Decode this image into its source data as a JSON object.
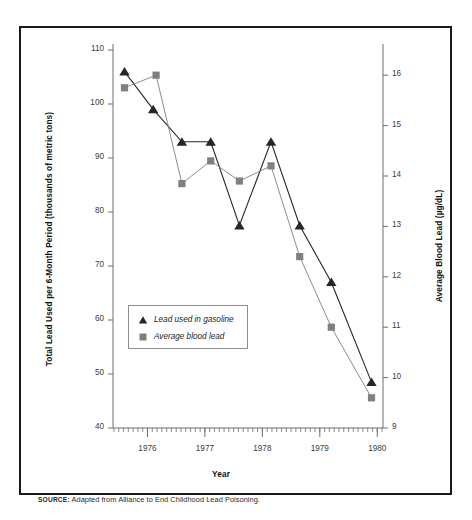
{
  "source": {
    "label": "SOURCE:",
    "text": "Adapted from Alliance to End Childhood Lead Poisoning."
  },
  "colors": {
    "gasoline_series": "#262626",
    "blood_series": "#808080",
    "axis": "#6e6e6e",
    "frame": "#1a1a1a",
    "text": "#111111"
  },
  "chart_data": {
    "type": "line",
    "title": "",
    "xlabel": "Year",
    "ylabel": "Total Lead Used per 6-Month Period (thousands of metric tons)",
    "y2label": "Average Blood Lead (µg/dL)",
    "xlim": [
      1975.4,
      1980.1
    ],
    "ylim": [
      40,
      110
    ],
    "y2lim": [
      9,
      16.5
    ],
    "yticks": [
      40,
      50,
      60,
      70,
      80,
      90,
      100,
      110
    ],
    "ytick_labels": [
      "40",
      "50",
      "60",
      "70",
      "80",
      "90",
      "100",
      "110"
    ],
    "y2ticks": [
      9,
      10,
      11,
      12,
      13,
      14,
      15,
      16
    ],
    "y2tick_labels": [
      "9",
      "10",
      "11",
      "12",
      "13",
      "14",
      "15",
      "16"
    ],
    "xticks": [
      1976,
      1977,
      1978,
      1979,
      1980
    ],
    "xtick_labels": [
      "1976",
      "1977",
      "1978",
      "1979",
      "1980"
    ],
    "minor_xticks_per_year": 12,
    "grid": false,
    "legend_position": "center-left",
    "series": [
      {
        "name": "Lead used in gasoline",
        "axis": "left",
        "marker": "triangle",
        "color": "#262626",
        "x": [
          1975.6,
          1976.1,
          1976.6,
          1977.1,
          1977.6,
          1978.15,
          1978.65,
          1979.2,
          1979.9
        ],
        "values": [
          106,
          99,
          93,
          93,
          77.5,
          93,
          77.5,
          67,
          48.5
        ]
      },
      {
        "name": "Average blood lead",
        "axis": "right",
        "marker": "square",
        "color": "#808080",
        "x": [
          1975.6,
          1976.15,
          1976.6,
          1977.1,
          1977.6,
          1978.15,
          1978.65,
          1979.2,
          1979.9
        ],
        "values": [
          15.75,
          16.0,
          13.85,
          14.3,
          13.9,
          14.2,
          12.4,
          11.0,
          9.6
        ]
      }
    ]
  }
}
